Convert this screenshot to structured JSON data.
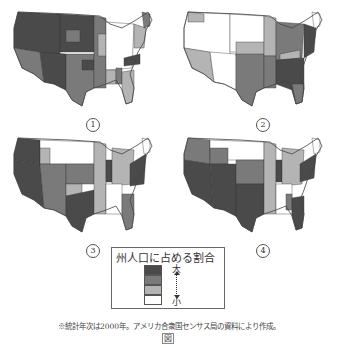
{
  "figure": {
    "maps": [
      {
        "label": "1",
        "description": "West, Southwest, Plains shaded darkest; Northeast/Midwest light"
      },
      {
        "label": "2",
        "description": "Southeast & Northeast darkest; West mostly light/white"
      },
      {
        "label": "3",
        "description": "West coast, Texas, Illinois, Northeast darkest"
      },
      {
        "label": "4",
        "description": "Southwest, California, Texas, Florida darkest"
      }
    ],
    "legend": {
      "title": "州人口に占める割合",
      "levels": [
        {
          "color": "#4a4a4a"
        },
        {
          "color": "#7a7a7a"
        },
        {
          "color": "#b4b4b4"
        },
        {
          "color": "#ffffff"
        }
      ],
      "high_label": "大",
      "low_label": "小"
    },
    "note": "※統計年次は2000年。アメリカ合衆国センサス局の資料により作成。",
    "caption": "図"
  },
  "colors": {
    "darkest": "#4a4a4a",
    "dark": "#7a7a7a",
    "light": "#b4b4b4",
    "none": "#ffffff"
  }
}
